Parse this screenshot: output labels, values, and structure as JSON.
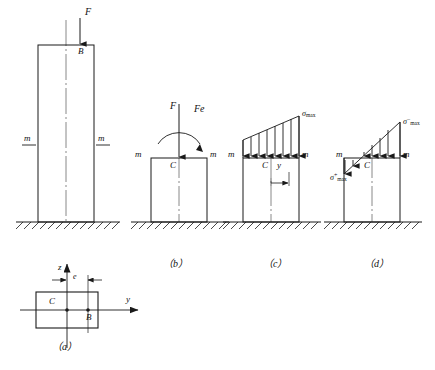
{
  "figure": {
    "captions": {
      "a": "（a）",
      "b": "（b）",
      "c": "（c）",
      "d": "（d）"
    },
    "panel_a": {
      "name": "cross-section",
      "axis_z": "z",
      "axis_y": "y",
      "centroid": "C",
      "load_point": "B",
      "eccentricity": "e"
    },
    "panel_main": {
      "name": "column-elevation",
      "force": "F",
      "load_point": "B",
      "section_label_left": "m",
      "section_label_right": "m"
    },
    "panel_b": {
      "name": "equivalent-force-and-couple",
      "force": "F",
      "moment": "Fe",
      "centroid": "C",
      "section_label_left": "m",
      "section_label_right": "m"
    },
    "panel_c": {
      "name": "compressive-stress-distribution",
      "sigma_max": "σ",
      "sigma_max_sub": "max",
      "centroid": "C",
      "distance": "y",
      "section_label_left": "m",
      "section_label_right": "m"
    },
    "panel_d": {
      "name": "combined-tension-compression-stress",
      "sigma_tension": "σ",
      "sigma_tension_sub": "max",
      "sigma_tension_sup": "+",
      "sigma_compression": "σ",
      "sigma_compression_sub": "max",
      "sigma_compression_sup": "−",
      "centroid": "C",
      "section_label_left": "m",
      "section_label_right": "m"
    },
    "colors": {
      "line": "#1a1a1a",
      "background": "#ffffff"
    }
  }
}
